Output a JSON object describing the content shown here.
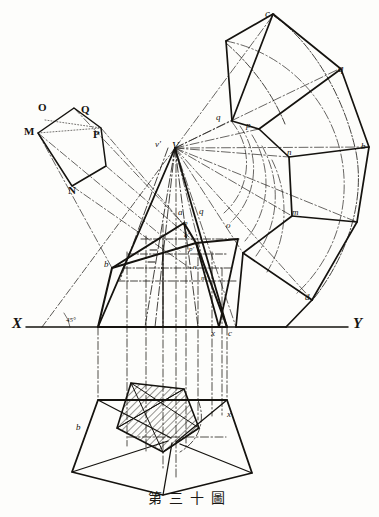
{
  "figure": {
    "title": "第三十圖",
    "caption_chars": [
      "第",
      "三",
      "十",
      "圖"
    ],
    "ink_color": "#15130f",
    "paper_color": "#fdfdfb"
  },
  "axes": {
    "x_label": "X",
    "y_label": "Y",
    "angle_note": "45°"
  },
  "true_shape_pentagon": {
    "name": "true-shape-pentagon",
    "vertices": [
      "M",
      "N",
      "P",
      "Q",
      "O"
    ]
  },
  "apex": {
    "vertex_prime": "v'",
    "vertex": "V"
  },
  "elevation": {
    "labels": [
      "a",
      "b",
      "c",
      "q",
      "p",
      "o",
      "n'",
      "m'",
      "q'",
      "p'",
      "x"
    ]
  },
  "development": {
    "labels": [
      "c",
      "q",
      "p",
      "n",
      "m",
      "d",
      "o",
      "b"
    ]
  },
  "plan": {
    "labels": [
      "b",
      "c",
      "x"
    ]
  }
}
